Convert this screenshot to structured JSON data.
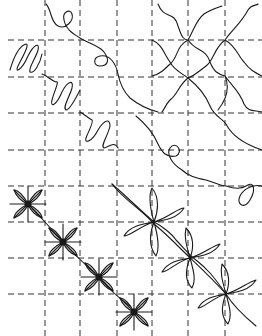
{
  "diagram": {
    "type": "quilting-motif-grid",
    "background": "#ffffff",
    "line_color": "#1a1a1a",
    "grid": {
      "style": "dashed",
      "vertical_x": [
        45,
        80,
        117,
        152,
        188,
        225
      ],
      "horizontal_y": [
        40,
        77,
        113,
        150,
        186,
        222,
        258,
        294
      ]
    },
    "motifs": [
      {
        "name": "meander-loops",
        "region": "top-center diagonal"
      },
      {
        "name": "zigzag-ribbon",
        "region": "upper-left diagonal"
      },
      {
        "name": "wavy-crosshatch",
        "region": "top-right block"
      },
      {
        "name": "meander-loops-2",
        "region": "right-center diagonal"
      },
      {
        "name": "petal-flowers",
        "region": "lower-right diagonal",
        "count": 3
      },
      {
        "name": "star-flowers",
        "region": "lower-left diagonal",
        "count": 4
      }
    ]
  }
}
